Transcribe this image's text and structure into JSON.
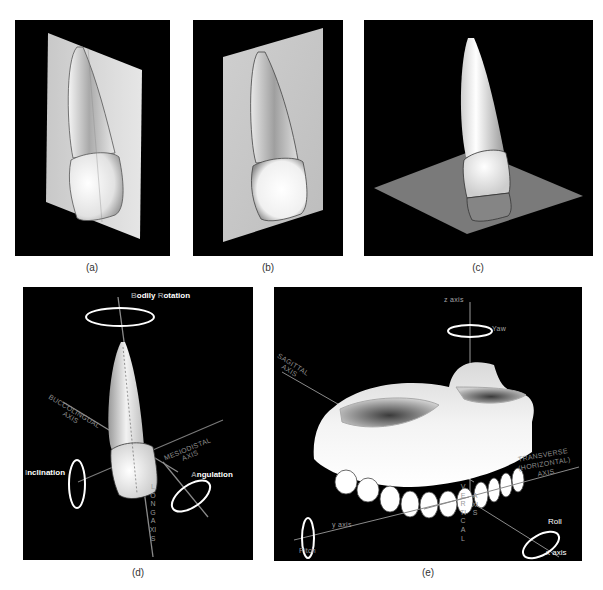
{
  "figure": {
    "panels": [
      {
        "id": "a",
        "caption": "(a)",
        "description": "Tooth with sagittal plane passing through it"
      },
      {
        "id": "b",
        "caption": "(b)",
        "description": "Tooth in front of a vertical plane"
      },
      {
        "id": "c",
        "caption": "(c)",
        "description": "Tooth crossing a horizontal plane"
      },
      {
        "id": "d",
        "caption": "(d)",
        "description": "Tooth rotation axes"
      },
      {
        "id": "e",
        "caption": "(e)",
        "description": "Maxillary arch with reference axes"
      }
    ]
  },
  "panel_d": {
    "bodily_rotation": {
      "first": "B",
      "rest": "odily ",
      "first2": "R",
      "rest2": "otation"
    },
    "inclination": {
      "first": "I",
      "rest": "nclination"
    },
    "angulation": {
      "first": "A",
      "rest": "ngulation"
    },
    "buccolingual_axis": [
      "BUCCOLINGUAL",
      "AXIS"
    ],
    "mesiodistal_axis": [
      "MESIODISTAL",
      "AXIS"
    ],
    "long_axis": "LONG AXIS"
  },
  "panel_e": {
    "z_axis": "z axis",
    "yaw": "Yaw",
    "sagittal_axis": [
      "SAGITTAL",
      "AXIS"
    ],
    "transverse_axis": [
      "TRANSVERSE",
      "(HORIZONTAL)",
      "AXIS"
    ],
    "y_axis": "y axis",
    "pitch": "Pitch",
    "vertical_axis": [
      "VERTICAL",
      "AXIS"
    ],
    "roll": "Roll",
    "x_axis": "x axis"
  },
  "colors": {
    "panel_background": "#000000",
    "plane_light": "#d9d9d9",
    "plane_gray": "#7a7a7a",
    "label_white": "#ffffff",
    "label_gray": "#8c8c8c"
  }
}
